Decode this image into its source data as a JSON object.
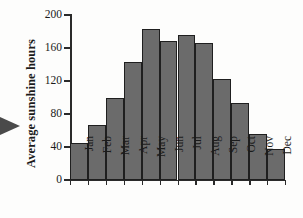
{
  "figure": {
    "arrow_marker": "right-pointing-triangle",
    "bar_fill_color": "#6b6b6b",
    "bar_edge_color": "#1f1f1f",
    "axis_color": "#2a2a2a",
    "background_color": "#fdfdfc"
  },
  "chart_data": {
    "type": "bar",
    "title": "",
    "xlabel": "",
    "ylabel": "Average sunshine hours",
    "categories": [
      "Jan",
      "Feb",
      "Mar",
      "Apr",
      "May",
      "Jun",
      "Jul",
      "Aug",
      "Sep",
      "Oct",
      "Nov",
      "Dec"
    ],
    "values": [
      45,
      67,
      99,
      143,
      183,
      168,
      176,
      166,
      123,
      93,
      56,
      37
    ],
    "ylim": [
      0,
      200
    ],
    "yticks": [
      0,
      40,
      80,
      120,
      160,
      200
    ],
    "ytick_labels": [
      "0",
      "40",
      "80",
      "120",
      "160",
      "200"
    ],
    "grid": false,
    "legend": null,
    "legend_position": "none"
  }
}
